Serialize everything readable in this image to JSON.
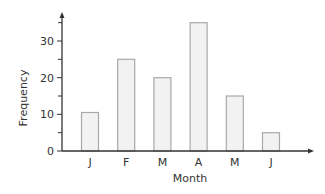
{
  "chart_data": {
    "type": "bar",
    "title": "",
    "xlabel": "Month",
    "ylabel": "Frequency",
    "categories": [
      "J",
      "F",
      "M",
      "A",
      "M",
      "J"
    ],
    "values": [
      10.5,
      25,
      20,
      35,
      15,
      5
    ],
    "ylim": [
      0,
      38
    ],
    "yticks": [
      0,
      10,
      20,
      30
    ],
    "minor_yticks": [
      5,
      15,
      25,
      35
    ],
    "grid": false,
    "legend": null
  },
  "colors": {
    "bar_fill": "#f2f2f2",
    "bar_stroke": "#a8a8a8",
    "axis": "#333333",
    "text": "#333333"
  }
}
